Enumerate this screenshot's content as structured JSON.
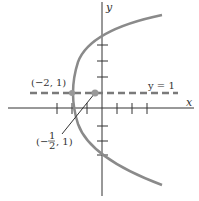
{
  "diagram": {
    "type": "parabola-graph",
    "equation_hint": "(y-1)^2 = 6(x+2)",
    "axes": {
      "x_label": "x",
      "y_label": "y",
      "x_ticks": [
        -3,
        -2,
        -1,
        1,
        2,
        3
      ],
      "y_ticks": [
        -3,
        -2,
        -1,
        1,
        2,
        3,
        4
      ]
    },
    "line": {
      "label": "y = 1",
      "style": "dashed"
    },
    "points": [
      {
        "label": "(−2, 1)",
        "x": -2,
        "y": 1,
        "role": "vertex"
      },
      {
        "label_prefix": "(−",
        "label_num": "1",
        "label_den": "2",
        "label_suffix": ", 1)",
        "x": -0.5,
        "y": 1,
        "role": "focus"
      }
    ],
    "colors": {
      "curve": "#8a8a8a",
      "axes": "#333333",
      "dashed_line": "#7a7a7a",
      "points": "#999999"
    }
  }
}
